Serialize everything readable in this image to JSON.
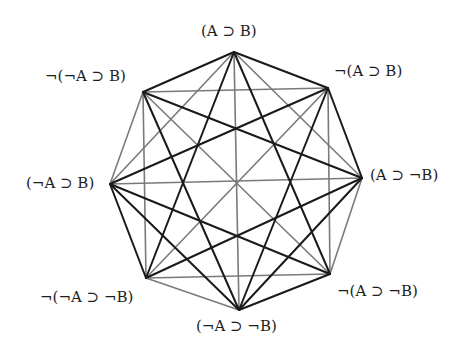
{
  "diagram": {
    "type": "octagon-of-opposition",
    "nodes": [
      {
        "id": "T",
        "label": "(A ⊃ B)",
        "x": 234,
        "y": 52,
        "lx": 201,
        "ly": 24,
        "anchor": "left"
      },
      {
        "id": "UR",
        "label": "¬(A ⊃ B)",
        "x": 328,
        "y": 88,
        "lx": 334,
        "ly": 64,
        "anchor": "left"
      },
      {
        "id": "R",
        "label": "(A ⊃ ¬B)",
        "x": 362,
        "y": 178,
        "lx": 370,
        "ly": 168,
        "anchor": "left"
      },
      {
        "id": "LR",
        "label": "¬(A ⊃ ¬B)",
        "x": 330,
        "y": 274,
        "lx": 337,
        "ly": 284,
        "anchor": "left"
      },
      {
        "id": "B",
        "label": "(¬A ⊃ ¬B)",
        "x": 239,
        "y": 310,
        "lx": 196,
        "ly": 319,
        "anchor": "left"
      },
      {
        "id": "LL",
        "label": "¬(¬A ⊃ ¬B)",
        "x": 146,
        "y": 278,
        "lx": 40,
        "ly": 290,
        "anchor": "left"
      },
      {
        "id": "L",
        "label": "(¬A ⊃ B)",
        "x": 110,
        "y": 184,
        "lx": 26,
        "ly": 176,
        "anchor": "left"
      },
      {
        "id": "UL",
        "label": "¬(¬A ⊃ B)",
        "x": 143,
        "y": 92,
        "lx": 45,
        "ly": 69,
        "anchor": "left"
      }
    ],
    "edges": [
      {
        "from": "T",
        "to": "UR",
        "style": "dark"
      },
      {
        "from": "UR",
        "to": "R",
        "style": "dark"
      },
      {
        "from": "R",
        "to": "LR",
        "style": "gray"
      },
      {
        "from": "LR",
        "to": "B",
        "style": "dark"
      },
      {
        "from": "B",
        "to": "LL",
        "style": "gray"
      },
      {
        "from": "LL",
        "to": "L",
        "style": "dark"
      },
      {
        "from": "L",
        "to": "UL",
        "style": "gray"
      },
      {
        "from": "UL",
        "to": "T",
        "style": "dark"
      },
      {
        "from": "T",
        "to": "R",
        "style": "gray"
      },
      {
        "from": "UR",
        "to": "LR",
        "style": "gray"
      },
      {
        "from": "R",
        "to": "B",
        "style": "dark"
      },
      {
        "from": "LR",
        "to": "LL",
        "style": "gray"
      },
      {
        "from": "B",
        "to": "L",
        "style": "dark"
      },
      {
        "from": "LL",
        "to": "UL",
        "style": "gray"
      },
      {
        "from": "L",
        "to": "T",
        "style": "gray"
      },
      {
        "from": "UL",
        "to": "UR",
        "style": "gray"
      },
      {
        "from": "T",
        "to": "LR",
        "style": "dark"
      },
      {
        "from": "UR",
        "to": "B",
        "style": "dark"
      },
      {
        "from": "R",
        "to": "LL",
        "style": "dark"
      },
      {
        "from": "LR",
        "to": "L",
        "style": "dark"
      },
      {
        "from": "B",
        "to": "UL",
        "style": "dark"
      },
      {
        "from": "LL",
        "to": "T",
        "style": "dark"
      },
      {
        "from": "L",
        "to": "UR",
        "style": "dark"
      },
      {
        "from": "UL",
        "to": "R",
        "style": "dark"
      },
      {
        "from": "T",
        "to": "B",
        "style": "gray"
      },
      {
        "from": "UR",
        "to": "LL",
        "style": "gray"
      },
      {
        "from": "R",
        "to": "L",
        "style": "gray"
      },
      {
        "from": "LR",
        "to": "UL",
        "style": "gray"
      }
    ],
    "styles": {
      "dark": {
        "color": "#1a1a1a",
        "width": 2.0
      },
      "gray": {
        "color": "#7a7a7a",
        "width": 1.6
      }
    }
  }
}
